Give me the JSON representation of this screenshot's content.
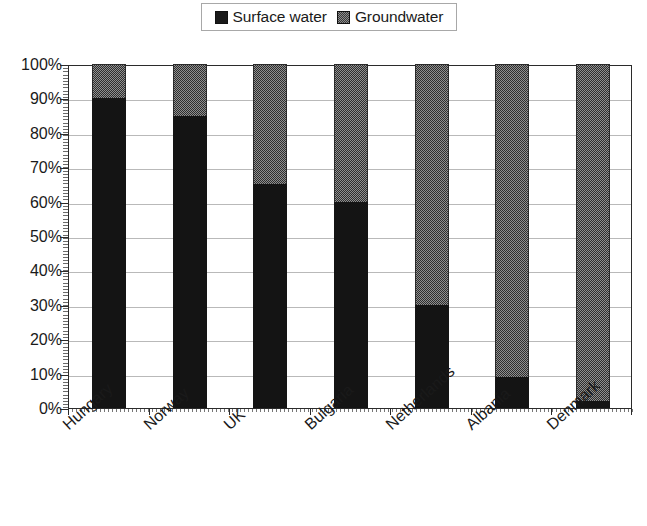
{
  "legend": {
    "position": "top-center",
    "entries": [
      {
        "label": "Surface water",
        "swatch": "solid-black-swatch",
        "color": "#141414"
      },
      {
        "label": "Groundwater",
        "swatch": "dither-gray-swatch",
        "color": "#8f8f8f"
      }
    ]
  },
  "axes": {
    "y_ticks": [
      "100%",
      "90%",
      "80%",
      "70%",
      "60%",
      "50%",
      "40%",
      "30%",
      "20%",
      "10%",
      "0%"
    ],
    "x_categories": [
      "Hungary",
      "Norway",
      "UK",
      "Bulgaria",
      "Netherlands",
      "Albania",
      "Denmark"
    ]
  },
  "chart_data": {
    "type": "bar",
    "stacked": true,
    "normalized": "100%",
    "title": "",
    "subtitle": "",
    "xlabel": "",
    "ylabel": "",
    "ylim": [
      0,
      100
    ],
    "ytick_values": [
      0,
      10,
      20,
      30,
      40,
      50,
      60,
      70,
      80,
      90,
      100
    ],
    "ytick_labels": [
      "0%",
      "10%",
      "20%",
      "30%",
      "40%",
      "50%",
      "60%",
      "70%",
      "80%",
      "90%",
      "100%"
    ],
    "grid": "horizontal",
    "legend_position": "top-center",
    "categories": [
      "Hungary",
      "Norway",
      "UK",
      "Bulgaria",
      "Netherlands",
      "Albania",
      "Denmark"
    ],
    "series": [
      {
        "name": "Surface water",
        "color": "#141414",
        "pattern": "solid",
        "values": [
          90,
          85,
          65,
          60,
          30,
          9,
          2
        ]
      },
      {
        "name": "Groundwater",
        "color": "#8f8f8f",
        "pattern": "dither-checker",
        "values": [
          10,
          15,
          35,
          40,
          70,
          91,
          98
        ]
      }
    ],
    "units": "percent"
  }
}
